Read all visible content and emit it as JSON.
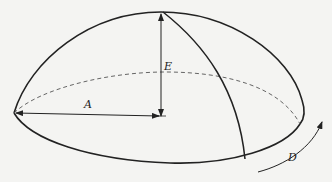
{
  "diagram": {
    "labels": {
      "radius": "A",
      "height": "E",
      "circumference_direction": "D"
    },
    "colors": {
      "stroke": "#222222",
      "dashed": "#555555",
      "background": "#f4f4f2"
    }
  }
}
